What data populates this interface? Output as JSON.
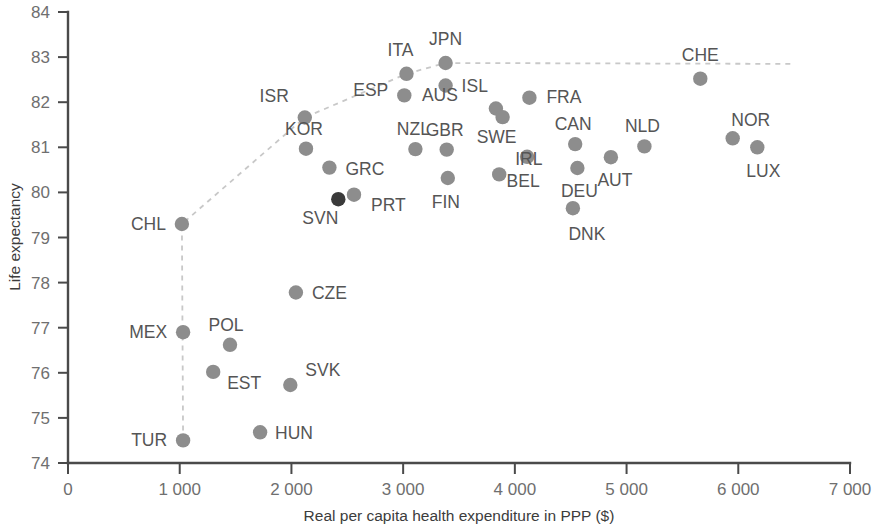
{
  "chart_data": {
    "type": "scatter",
    "title": "",
    "xlabel": "Real per capita health expenditure in PPP ($)",
    "ylabel": "Life expectancy",
    "xlim": [
      0,
      7000
    ],
    "ylim": [
      74,
      84
    ],
    "xticks": [
      0,
      1000,
      2000,
      3000,
      4000,
      5000,
      6000,
      7000
    ],
    "xticklabels": [
      "0",
      "1 000",
      "2 000",
      "3 000",
      "4 000",
      "5 000",
      "6 000",
      "7 000"
    ],
    "yticks": [
      74,
      75,
      76,
      77,
      78,
      79,
      80,
      81,
      82,
      83,
      84
    ],
    "yticklabels": [
      "74",
      "75",
      "76",
      "77",
      "78",
      "79",
      "80",
      "81",
      "82",
      "83",
      "84"
    ],
    "grid": false,
    "legend": null,
    "point_color": "#8d8d8d",
    "highlight_color": "#3a3a3a",
    "frontier_color": "#c8c8c8",
    "points": [
      {
        "label": "TUR",
        "x": 1030,
        "y": 74.5,
        "lx": -16,
        "ly": 6,
        "anchor": "end"
      },
      {
        "label": "MEX",
        "x": 1030,
        "y": 76.9,
        "lx": -16,
        "ly": 6,
        "anchor": "end"
      },
      {
        "label": "CHL",
        "x": 1020,
        "y": 79.3,
        "lx": -16,
        "ly": 6,
        "anchor": "end"
      },
      {
        "label": "EST",
        "x": 1300,
        "y": 76.02,
        "lx": 14,
        "ly": 17,
        "anchor": "start"
      },
      {
        "label": "POL",
        "x": 1450,
        "y": 76.62,
        "lx": -4,
        "ly": -14,
        "anchor": "middle"
      },
      {
        "label": "HUN",
        "x": 1720,
        "y": 74.68,
        "lx": 15,
        "ly": 7,
        "anchor": "start"
      },
      {
        "label": "SVK",
        "x": 1990,
        "y": 75.73,
        "lx": 15,
        "ly": -9,
        "anchor": "start"
      },
      {
        "label": "CZE",
        "x": 2040,
        "y": 77.78,
        "lx": 16,
        "ly": 6,
        "anchor": "start"
      },
      {
        "label": "KOR",
        "x": 2130,
        "y": 80.97,
        "lx": -2,
        "ly": -14,
        "anchor": "middle"
      },
      {
        "label": "ISR",
        "x": 2120,
        "y": 81.66,
        "lx": -16,
        "ly": -16,
        "anchor": "end"
      },
      {
        "label": "GRC",
        "x": 2340,
        "y": 80.55,
        "lx": 16,
        "ly": 7,
        "anchor": "start"
      },
      {
        "label": "SVN",
        "x": 2420,
        "y": 79.85,
        "lx": -18,
        "ly": 25,
        "anchor": "middle",
        "highlight": true
      },
      {
        "label": "PRT",
        "x": 2560,
        "y": 79.95,
        "lx": 17,
        "ly": 16,
        "anchor": "start"
      },
      {
        "label": "ESP",
        "x": 3010,
        "y": 82.15,
        "lx": -16,
        "ly": 1,
        "anchor": "end"
      },
      {
        "label": "ITA",
        "x": 3030,
        "y": 82.63,
        "lx": -6,
        "ly": -18,
        "anchor": "middle"
      },
      {
        "label": "NZL",
        "x": 3110,
        "y": 80.96,
        "lx": -2,
        "ly": -14,
        "anchor": "middle"
      },
      {
        "label": "JPN",
        "x": 3380,
        "y": 82.87,
        "lx": 0,
        "ly": -18,
        "anchor": "middle"
      },
      {
        "label": "ISL",
        "x": 3380,
        "y": 82.37,
        "lx": 16,
        "ly": 6,
        "anchor": "start"
      },
      {
        "label": "GBR",
        "x": 3390,
        "y": 80.95,
        "lx": -2,
        "ly": -14,
        "anchor": "middle"
      },
      {
        "label": "FIN",
        "x": 3400,
        "y": 80.32,
        "lx": -2,
        "ly": 30,
        "anchor": "middle"
      },
      {
        "label": "AUS",
        "x": 3830,
        "y": 81.86,
        "lx": -56,
        "ly": -8,
        "anchor": "middle"
      },
      {
        "label": "IRL",
        "x": 3860,
        "y": 80.4,
        "lx": 16,
        "ly": -9,
        "anchor": "start"
      },
      {
        "label": "SWE",
        "x": 3890,
        "y": 81.67,
        "lx": -6,
        "ly": 26,
        "anchor": "middle"
      },
      {
        "label": "BEL",
        "x": 4110,
        "y": 80.79,
        "lx": -4,
        "ly": 30,
        "anchor": "middle"
      },
      {
        "label": "FRA",
        "x": 4130,
        "y": 82.1,
        "lx": 17,
        "ly": 5,
        "anchor": "start"
      },
      {
        "label": "DNK",
        "x": 4520,
        "y": 79.65,
        "lx": 14,
        "ly": 32,
        "anchor": "middle"
      },
      {
        "label": "CAN",
        "x": 4540,
        "y": 81.07,
        "lx": -2,
        "ly": -14,
        "anchor": "middle"
      },
      {
        "label": "DEU",
        "x": 4560,
        "y": 80.54,
        "lx": 2,
        "ly": 29,
        "anchor": "middle"
      },
      {
        "label": "AUT",
        "x": 4860,
        "y": 80.78,
        "lx": 4,
        "ly": 29,
        "anchor": "middle"
      },
      {
        "label": "NLD",
        "x": 5160,
        "y": 81.02,
        "lx": -2,
        "ly": -14,
        "anchor": "middle"
      },
      {
        "label": "CHE",
        "x": 5660,
        "y": 82.52,
        "lx": 0,
        "ly": -18,
        "anchor": "middle"
      },
      {
        "label": "NOR",
        "x": 5950,
        "y": 81.2,
        "lx": 18,
        "ly": -12,
        "anchor": "middle"
      },
      {
        "label": "LUX",
        "x": 6170,
        "y": 81.0,
        "lx": 6,
        "ly": 30,
        "anchor": "middle"
      }
    ],
    "frontier": [
      {
        "x": 1030,
        "y": 74.5
      },
      {
        "x": 1025,
        "y": 76.9
      },
      {
        "x": 1020,
        "y": 79.3
      },
      {
        "x": 2120,
        "y": 81.66
      },
      {
        "x": 3030,
        "y": 82.63
      },
      {
        "x": 3380,
        "y": 82.87
      },
      {
        "x": 6500,
        "y": 82.85
      }
    ]
  }
}
